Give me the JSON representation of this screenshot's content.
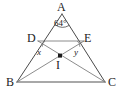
{
  "figure": {
    "type": "euclidean-geometry-diagram",
    "background_color": "#ffffff",
    "stroke_color": "#4a4a4a",
    "base_stroke_color": "#8c8c8c",
    "text_color": "#1c1c1c",
    "points": {
      "A": {
        "label": "A",
        "x": 62,
        "y": 14
      },
      "B": {
        "label": "B",
        "x": 17,
        "y": 82
      },
      "C": {
        "label": "C",
        "x": 105,
        "y": 82
      },
      "D": {
        "label": "D",
        "x": 38,
        "y": 41
      },
      "E": {
        "label": "E",
        "x": 84,
        "y": 41
      },
      "I": {
        "label": "I",
        "x": 60,
        "y": 56
      }
    },
    "segments": [
      {
        "name": "side-AB",
        "from": "A",
        "to": "B"
      },
      {
        "name": "side-AC",
        "from": "A",
        "to": "C"
      },
      {
        "name": "base-BC",
        "from": "B",
        "to": "C"
      },
      {
        "name": "segment-DE",
        "from": "D",
        "to": "E"
      },
      {
        "name": "cevian-BE",
        "from": "B",
        "to": "E"
      },
      {
        "name": "cevian-CD",
        "from": "C",
        "to": "D"
      }
    ],
    "angles": [
      {
        "name": "angle-at-A",
        "vertex": "A",
        "value": "64",
        "unit": "°",
        "display": "64°",
        "marked": true
      },
      {
        "name": "angle-x-at-D",
        "vertex": "D",
        "value": "x",
        "display": "x",
        "marked": true
      },
      {
        "name": "angle-y-at-E",
        "vertex": "E",
        "value": "y",
        "display": "y",
        "marked": true
      }
    ]
  },
  "labels": {
    "A": "A",
    "B": "B",
    "C": "C",
    "D": "D",
    "E": "E",
    "I": "I",
    "angle_a": "64°",
    "angle_x": "x",
    "angle_y": "y"
  }
}
